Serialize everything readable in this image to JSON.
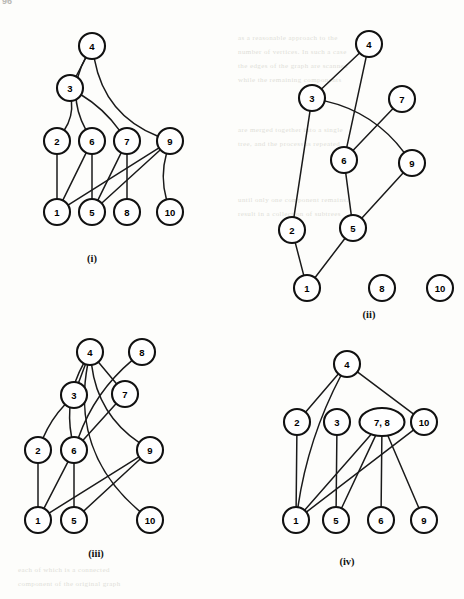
{
  "page": {
    "number": "96"
  },
  "figure": {
    "caption_i": "(i)",
    "caption_ii": "(ii)",
    "caption_iii": "(iii)",
    "caption_iv": "(iv)"
  },
  "background_text": {
    "lines": [
      "as a reasonable approach to the",
      "number of vertices. In such a case",
      "the edges of the graph are scanned",
      "while the remaining components",
      "are merged together into a single",
      "tree, and the process is repeated",
      "until only one component remains.",
      "result in a collection of subtrees",
      "each of which is a connected",
      "component of the original graph"
    ]
  },
  "graphs": [
    {
      "id": "i",
      "label": "(i)",
      "nodes": [
        {
          "id": "4",
          "text": "4",
          "cx": 92,
          "cy": 46,
          "rx": 13,
          "ry": 13
        },
        {
          "id": "3",
          "text": "3",
          "cx": 70,
          "cy": 88,
          "rx": 13,
          "ry": 13
        },
        {
          "id": "2",
          "text": "2",
          "cx": 57,
          "cy": 141,
          "rx": 13,
          "ry": 13
        },
        {
          "id": "6",
          "text": "6",
          "cx": 92,
          "cy": 141,
          "rx": 13,
          "ry": 13
        },
        {
          "id": "7",
          "text": "7",
          "cx": 127,
          "cy": 141,
          "rx": 13,
          "ry": 13
        },
        {
          "id": "9",
          "text": "9",
          "cx": 170,
          "cy": 141,
          "rx": 13,
          "ry": 13
        },
        {
          "id": "1",
          "text": "1",
          "cx": 57,
          "cy": 212,
          "rx": 13,
          "ry": 13
        },
        {
          "id": "5",
          "text": "5",
          "cx": 92,
          "cy": 212,
          "rx": 13,
          "ry": 13
        },
        {
          "id": "8",
          "text": "8",
          "cx": 127,
          "cy": 212,
          "rx": 13,
          "ry": 13
        },
        {
          "id": "10",
          "text": "10",
          "cx": 170,
          "cy": 212,
          "rx": 13,
          "ry": 13
        }
      ],
      "edges": [
        {
          "from": "4",
          "to": "3",
          "kind": "line"
        },
        {
          "from": "4",
          "to": "6",
          "kind": "curve",
          "bend": 26
        },
        {
          "from": "4",
          "to": "9",
          "kind": "curve",
          "bend": 34
        },
        {
          "from": "3",
          "to": "2",
          "kind": "curve",
          "bend": -10
        },
        {
          "from": "3",
          "to": "7",
          "kind": "curve",
          "bend": -8
        },
        {
          "from": "2",
          "to": "1",
          "kind": "line"
        },
        {
          "from": "6",
          "to": "1",
          "kind": "line"
        },
        {
          "from": "6",
          "to": "5",
          "kind": "line"
        },
        {
          "from": "7",
          "to": "5",
          "kind": "line"
        },
        {
          "from": "7",
          "to": "8",
          "kind": "line"
        },
        {
          "from": "9",
          "to": "1",
          "kind": "line"
        },
        {
          "from": "9",
          "to": "5",
          "kind": "line"
        },
        {
          "from": "9",
          "to": "10",
          "kind": "curve",
          "bend": 10
        }
      ],
      "caption_pos": {
        "x": 92,
        "y": 262
      }
    },
    {
      "id": "ii",
      "label": "(ii)",
      "nodes": [
        {
          "id": "4",
          "text": "4",
          "cx": 369,
          "cy": 44,
          "rx": 13,
          "ry": 13
        },
        {
          "id": "3",
          "text": "3",
          "cx": 312,
          "cy": 98,
          "rx": 13,
          "ry": 13
        },
        {
          "id": "7",
          "text": "7",
          "cx": 402,
          "cy": 99,
          "rx": 13,
          "ry": 13
        },
        {
          "id": "6",
          "text": "6",
          "cx": 344,
          "cy": 160,
          "rx": 13,
          "ry": 13
        },
        {
          "id": "9",
          "text": "9",
          "cx": 412,
          "cy": 163,
          "rx": 13,
          "ry": 13
        },
        {
          "id": "2",
          "text": "2",
          "cx": 292,
          "cy": 230,
          "rx": 13,
          "ry": 13
        },
        {
          "id": "5",
          "text": "5",
          "cx": 353,
          "cy": 228,
          "rx": 13,
          "ry": 13
        },
        {
          "id": "1",
          "text": "1",
          "cx": 307,
          "cy": 288,
          "rx": 13,
          "ry": 13
        },
        {
          "id": "8",
          "text": "8",
          "cx": 382,
          "cy": 288,
          "rx": 13,
          "ry": 13
        },
        {
          "id": "10",
          "text": "10",
          "cx": 440,
          "cy": 288,
          "rx": 13,
          "ry": 13
        }
      ],
      "edges": [
        {
          "from": "4",
          "to": "3",
          "kind": "line"
        },
        {
          "from": "4",
          "to": "6",
          "kind": "line"
        },
        {
          "from": "3",
          "to": "9",
          "kind": "curve",
          "bend": -22
        },
        {
          "from": "3",
          "to": "2",
          "kind": "line"
        },
        {
          "from": "7",
          "to": "6",
          "kind": "line"
        },
        {
          "from": "6",
          "to": "5",
          "kind": "line"
        },
        {
          "from": "9",
          "to": "5",
          "kind": "line"
        },
        {
          "from": "2",
          "to": "1",
          "kind": "line"
        },
        {
          "from": "5",
          "to": "1",
          "kind": "line"
        }
      ],
      "caption_pos": {
        "x": 369,
        "y": 318
      }
    },
    {
      "id": "iii",
      "label": "(iii)",
      "nodes": [
        {
          "id": "4",
          "text": "4",
          "cx": 90,
          "cy": 352,
          "rx": 13,
          "ry": 13
        },
        {
          "id": "8",
          "text": "8",
          "cx": 142,
          "cy": 352,
          "rx": 13,
          "ry": 13
        },
        {
          "id": "3",
          "text": "3",
          "cx": 74,
          "cy": 395,
          "rx": 13,
          "ry": 13
        },
        {
          "id": "7",
          "text": "7",
          "cx": 125,
          "cy": 394,
          "rx": 13,
          "ry": 13
        },
        {
          "id": "2",
          "text": "2",
          "cx": 38,
          "cy": 450,
          "rx": 13,
          "ry": 13
        },
        {
          "id": "6",
          "text": "6",
          "cx": 74,
          "cy": 450,
          "rx": 13,
          "ry": 13
        },
        {
          "id": "9",
          "text": "9",
          "cx": 150,
          "cy": 450,
          "rx": 13,
          "ry": 13
        },
        {
          "id": "1",
          "text": "1",
          "cx": 38,
          "cy": 520,
          "rx": 13,
          "ry": 13
        },
        {
          "id": "5",
          "text": "5",
          "cx": 74,
          "cy": 520,
          "rx": 13,
          "ry": 13
        },
        {
          "id": "10",
          "text": "10",
          "cx": 150,
          "cy": 520,
          "rx": 13,
          "ry": 13
        }
      ],
      "edges": [
        {
          "from": "4",
          "to": "3",
          "kind": "line"
        },
        {
          "from": "4",
          "to": "6",
          "kind": "curve",
          "bend": 18
        },
        {
          "from": "4",
          "to": "7",
          "kind": "line"
        },
        {
          "from": "4",
          "to": "9",
          "kind": "curve",
          "bend": 26
        },
        {
          "from": "4",
          "to": "10",
          "kind": "curve",
          "bend": 52
        },
        {
          "from": "8",
          "to": "6",
          "kind": "curve",
          "bend": 16
        },
        {
          "from": "3",
          "to": "2",
          "kind": "curve",
          "bend": 6
        },
        {
          "from": "7",
          "to": "6",
          "kind": "line"
        },
        {
          "from": "2",
          "to": "1",
          "kind": "line"
        },
        {
          "from": "6",
          "to": "1",
          "kind": "line"
        },
        {
          "from": "6",
          "to": "5",
          "kind": "line"
        },
        {
          "from": "9",
          "to": "1",
          "kind": "line"
        },
        {
          "from": "9",
          "to": "5",
          "kind": "line"
        }
      ],
      "caption_pos": {
        "x": 96,
        "y": 557
      }
    },
    {
      "id": "iv",
      "label": "(iv)",
      "nodes": [
        {
          "id": "4",
          "text": "4",
          "cx": 347,
          "cy": 364,
          "rx": 13,
          "ry": 13
        },
        {
          "id": "2",
          "text": "2",
          "cx": 297,
          "cy": 422,
          "rx": 13,
          "ry": 13
        },
        {
          "id": "3",
          "text": "3",
          "cx": 337,
          "cy": 422,
          "rx": 13,
          "ry": 13
        },
        {
          "id": "78",
          "text": "7, 8",
          "cx": 382,
          "cy": 422,
          "rx": 22.5,
          "ry": 14
        },
        {
          "id": "10",
          "text": "10",
          "cx": 424,
          "cy": 422,
          "rx": 13,
          "ry": 13
        },
        {
          "id": "1",
          "text": "1",
          "cx": 296,
          "cy": 520,
          "rx": 13,
          "ry": 13
        },
        {
          "id": "5",
          "text": "5",
          "cx": 336,
          "cy": 520,
          "rx": 13,
          "ry": 13
        },
        {
          "id": "6",
          "text": "6",
          "cx": 381,
          "cy": 520,
          "rx": 13,
          "ry": 13
        },
        {
          "id": "9",
          "text": "9",
          "cx": 424,
          "cy": 520,
          "rx": 13,
          "ry": 13
        }
      ],
      "edges": [
        {
          "from": "4",
          "to": "2",
          "kind": "line"
        },
        {
          "from": "4",
          "to": "10",
          "kind": "line"
        },
        {
          "from": "4",
          "to": "1",
          "kind": "curve",
          "bend": 14
        },
        {
          "from": "2",
          "to": "1",
          "kind": "line"
        },
        {
          "from": "3",
          "to": "5",
          "kind": "line"
        },
        {
          "from": "78",
          "to": "1",
          "kind": "line"
        },
        {
          "from": "78",
          "to": "5",
          "kind": "line"
        },
        {
          "from": "78",
          "to": "6",
          "kind": "line"
        },
        {
          "from": "78",
          "to": "9",
          "kind": "line"
        },
        {
          "from": "10",
          "to": "1",
          "kind": "line"
        }
      ],
      "caption_pos": {
        "x": 347,
        "y": 565
      }
    }
  ]
}
